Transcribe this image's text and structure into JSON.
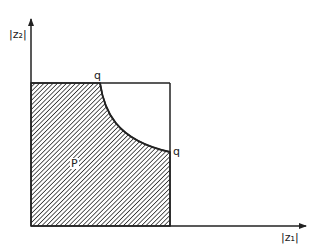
{
  "diagram": {
    "axes": {
      "y_label": "|z₂|",
      "x_label": "|z₁|"
    },
    "region_label": "P",
    "corner_labels": [
      "q",
      "q"
    ],
    "colors": {
      "ink": "#222222",
      "background": "#ffffff"
    }
  }
}
